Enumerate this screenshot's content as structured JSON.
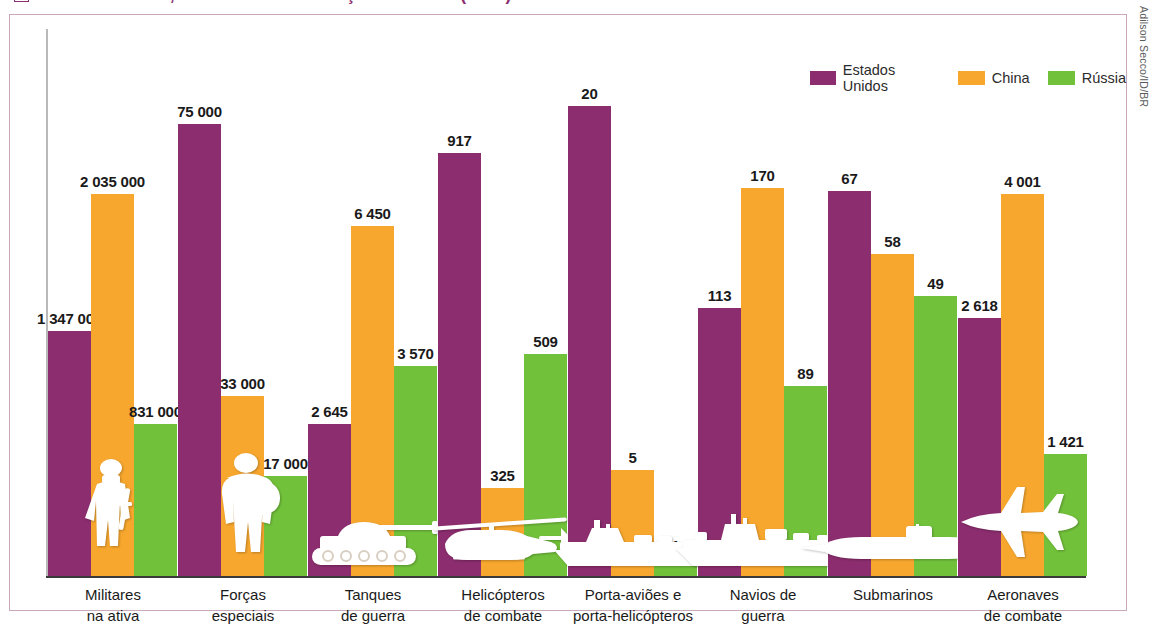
{
  "title": {
    "text": "Estados Unidos, China e Rússia: Forças Armadas (2022)",
    "color": "#8B2D6E"
  },
  "credit": {
    "text": "Adilson Secco/ID/BR"
  },
  "legend": {
    "items": [
      {
        "label": "Estados Unidos",
        "color": "#8B2D6E"
      },
      {
        "label": "China",
        "color": "#F7A72E"
      },
      {
        "label": "Rússia",
        "color": "#72C13B"
      }
    ]
  },
  "chart_data": {
    "type": "bar",
    "title": "Estados Unidos, China e Rússia: Forças Armadas (2022)",
    "xlabel": "",
    "ylabel": "",
    "grid": false,
    "legend_position": "top-right",
    "note": "Each category group is scaled independently; bar heights are not on a single shared axis.",
    "categories": [
      "Militares na ativa",
      "Forças especiais",
      "Tanques de guerra",
      "Helicópteros de combate",
      "Porta-aviões e porta-helicópteros",
      "Navios de guerra",
      "Submarinos",
      "Aeronaves de combate"
    ],
    "category_lines": [
      [
        "Militares",
        "na ativa"
      ],
      [
        "Forças",
        "especiais"
      ],
      [
        "Tanques",
        "de guerra"
      ],
      [
        "Helicópteros",
        "de combate"
      ],
      [
        "Porta-aviões e",
        "porta-helicópteros"
      ],
      [
        "Navios de",
        "guerra"
      ],
      [
        "Submarinos",
        ""
      ],
      [
        "Aeronaves",
        "de combate"
      ]
    ],
    "series": [
      {
        "name": "Estados Unidos",
        "color": "#8B2D6E",
        "values": [
          1347000,
          75000,
          2645,
          917,
          20,
          113,
          67,
          2618
        ],
        "labels": [
          "1 347 000",
          "75 000",
          "2 645",
          "917",
          "20",
          "113",
          "67",
          "2 618"
        ]
      },
      {
        "name": "China",
        "color": "#F7A72E",
        "values": [
          2035000,
          33000,
          6450,
          325,
          5,
          170,
          58,
          4001
        ],
        "labels": [
          "2 035 000",
          "33 000",
          "6 450",
          "325",
          "5",
          "170",
          "58",
          "4 001"
        ]
      },
      {
        "name": "Rússia",
        "color": "#72C13B",
        "values": [
          831000,
          17000,
          3570,
          509,
          1,
          89,
          49,
          1421
        ],
        "labels": [
          "831 000",
          "17 000",
          "3 570",
          "509",
          "1",
          "89",
          "49",
          "1 421"
        ]
      }
    ],
    "icons": [
      "soldier-icon",
      "special-forces-soldier-icon",
      "battle-tank-icon",
      "combat-helicopter-icon",
      "aircraft-carrier-icon",
      "warship-icon",
      "submarine-icon",
      "fighter-jet-icon"
    ]
  },
  "render": {
    "group_pixel_heights": [
      [
        245,
        382,
        152
      ],
      [
        452,
        180,
        100
      ],
      [
        152,
        350,
        210
      ],
      [
        423,
        88,
        222
      ],
      [
        470,
        106,
        18
      ],
      [
        268,
        388,
        190
      ],
      [
        385,
        322,
        280
      ],
      [
        258,
        382,
        122
      ]
    ],
    "group_x": [
      0,
      130,
      262,
      392,
      522,
      654,
      784,
      914
    ],
    "group_width": 130,
    "bar_width": 43
  }
}
